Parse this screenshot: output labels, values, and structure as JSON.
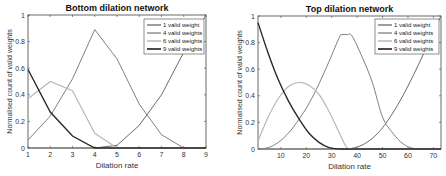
{
  "chart_data": [
    {
      "type": "line",
      "title": "Bottom dilation network",
      "xlabel": "Dilation rate",
      "ylabel": "Normalised count of valid weights",
      "xlim": [
        1,
        9
      ],
      "ylim": [
        0,
        1
      ],
      "xticks": [
        "1",
        "2",
        "3",
        "4",
        "5",
        "6",
        "7",
        "8",
        "9"
      ],
      "yticks": [
        "0",
        "0.2",
        "0.4",
        "0.6",
        "0.8",
        "1"
      ],
      "legend_position": "upper right",
      "grid": false,
      "x": [
        1,
        2,
        3,
        4,
        5,
        6,
        7,
        8,
        9
      ],
      "series": [
        {
          "name": "1 valid weight",
          "color": "#6a6a6a",
          "width": 1,
          "values": [
            0,
            0,
            0,
            0,
            0.02,
            0.17,
            0.4,
            0.72,
            1.0
          ]
        },
        {
          "name": "4 valid weights",
          "color": "#808080",
          "width": 1,
          "values": [
            0.06,
            0.24,
            0.52,
            0.89,
            0.67,
            0.33,
            0.1,
            0,
            0
          ]
        },
        {
          "name": "6 valid weights",
          "color": "#b8b8b8",
          "width": 1.2,
          "values": [
            0.37,
            0.5,
            0.43,
            0.11,
            0,
            0,
            0,
            0,
            0
          ]
        },
        {
          "name": "9 valid weights",
          "color": "#2a2a2a",
          "width": 1.4,
          "values": [
            0.59,
            0.27,
            0.09,
            0,
            0,
            0,
            0,
            0,
            0
          ]
        }
      ]
    },
    {
      "type": "line",
      "title": "Top dilation network",
      "xlabel": "Dilation rate",
      "ylabel": "Normalised count of valid weights",
      "xlim": [
        1,
        73
      ],
      "ylim": [
        0,
        1
      ],
      "xticks": [
        "10",
        "20",
        "30",
        "40",
        "50",
        "60",
        "70"
      ],
      "yticks": [
        "0",
        "0.2",
        "0.4",
        "0.6",
        "0.8",
        "1"
      ],
      "legend_position": "upper right",
      "grid": false,
      "x": [
        1,
        5,
        9,
        13,
        17,
        21,
        25,
        29,
        33,
        34,
        36,
        38,
        42,
        46,
        50,
        54,
        58,
        62,
        66,
        70,
        73
      ],
      "series": [
        {
          "name": "1 valid weight",
          "color": "#6a6a6a",
          "width": 1,
          "values": [
            0,
            0,
            0,
            0,
            0,
            0,
            0,
            0,
            0,
            0,
            0,
            0.005,
            0.03,
            0.08,
            0.16,
            0.27,
            0.4,
            0.55,
            0.71,
            0.88,
            1.0
          ]
        },
        {
          "name": "4 valid weights",
          "color": "#808080",
          "width": 1,
          "values": [
            0,
            0.01,
            0.05,
            0.12,
            0.22,
            0.34,
            0.49,
            0.66,
            0.84,
            0.86,
            0.86,
            0.85,
            0.69,
            0.5,
            0.24,
            0.12,
            0.04,
            0.005,
            0,
            0,
            0
          ]
        },
        {
          "name": "6 valid weights",
          "color": "#b8b8b8",
          "width": 1.2,
          "values": [
            0.06,
            0.24,
            0.38,
            0.47,
            0.5,
            0.48,
            0.41,
            0.28,
            0.12,
            0.08,
            0.01,
            0,
            0,
            0,
            0,
            0,
            0,
            0,
            0,
            0,
            0
          ]
        },
        {
          "name": "9 valid weights",
          "color": "#2a2a2a",
          "width": 1.4,
          "values": [
            0.95,
            0.72,
            0.52,
            0.36,
            0.23,
            0.12,
            0.05,
            0.01,
            0,
            0,
            0,
            0,
            0,
            0,
            0,
            0,
            0,
            0,
            0,
            0,
            0
          ]
        }
      ]
    }
  ]
}
